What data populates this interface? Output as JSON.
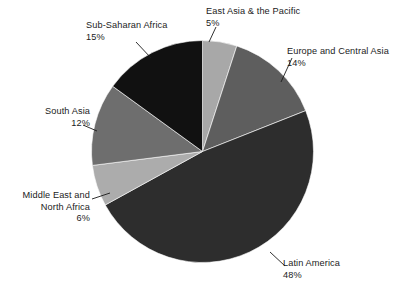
{
  "chart_data": {
    "type": "pie",
    "title": "",
    "subtitle": "",
    "xlabel": "",
    "ylabel": "",
    "legend_position": "none",
    "grid": false,
    "labels_show_percent": true,
    "start_angle_deg": 0,
    "direction": "clockwise",
    "categories": [
      "East Asia & the Pacific",
      "Europe and Central Asia",
      "Latin America",
      "Middle East and North Africa",
      "South Asia",
      "Sub-Saharan Africa"
    ],
    "values": [
      5,
      14,
      48,
      6,
      12,
      15
    ],
    "units": "percent",
    "total": 100,
    "slices": [
      {
        "label": "East Asia & the Pacific",
        "value": 5,
        "value_text": "5%",
        "color": "#a8a8a8"
      },
      {
        "label": "Europe and Central Asia",
        "value": 14,
        "value_text": "14%",
        "color": "#5e5e5e"
      },
      {
        "label": "Latin America",
        "value": 48,
        "value_text": "48%",
        "color": "#2d2d2d"
      },
      {
        "label": "Middle East and North Africa",
        "value": 6,
        "value_text": "6%",
        "color": "#acacac"
      },
      {
        "label": "South Asia",
        "value": 12,
        "value_text": "12%",
        "color": "#6e6e6e"
      },
      {
        "label": "Sub-Saharan Africa",
        "value": 15,
        "value_text": "15%",
        "color": "#111111"
      }
    ]
  },
  "labels": {
    "east_asia": {
      "name": "East Asia & the Pacific",
      "value": "5%"
    },
    "europe": {
      "name": "Europe and Central Asia",
      "value": "14%"
    },
    "latin": {
      "name": "Latin America",
      "value": "48%"
    },
    "mena": {
      "name_line1": "Middle East and",
      "name_line2": "North Africa",
      "value": "6%"
    },
    "south_asia": {
      "name": "South Asia",
      "value": "12%"
    },
    "subsaharan": {
      "name": "Sub-Saharan Africa",
      "value": "15%"
    }
  },
  "colors": {
    "background": "#ffffff",
    "text": "#1b1b1b",
    "leader_line": "#1b1b1b"
  }
}
